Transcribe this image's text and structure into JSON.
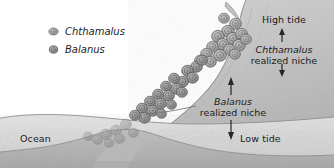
{
  "figure": {
    "type": "ecology-diagram"
  },
  "legend": {
    "items": [
      {
        "label": "Chthamalus",
        "icon": "barnacle-oval-icon",
        "color": "#9a9a9a"
      },
      {
        "label": "Balanus",
        "icon": "barnacle-round-icon",
        "color": "#8c8c8c"
      }
    ]
  },
  "labels": {
    "high_tide": "High tide",
    "low_tide": "Low tide",
    "ocean": "Ocean",
    "chthamalus_niche_line1": "Chthamalus",
    "chthamalus_niche_line2": "realized niche",
    "balanus_niche_line1": "Balanus",
    "balanus_niche_line2": "realized niche"
  },
  "colors": {
    "rock_light": "#c9c9c9",
    "rock_mid": "#bdbdbd",
    "rock_dark": "#a9a9a9",
    "water": "#d9d9d9",
    "seabed": "#b4b4b4",
    "ink": "#1c1c1c",
    "outline": "#6e6e6e",
    "barnacle_fill": "#b0b0b0",
    "barnacle_edge": "#5d5d5d",
    "page": "#ffffff"
  },
  "arrows": {
    "chthamalus_up": "arrow-up-icon",
    "chthamalus_down": "arrow-down-icon",
    "balanus_up": "arrow-up-icon",
    "balanus_down": "arrow-down-icon"
  }
}
